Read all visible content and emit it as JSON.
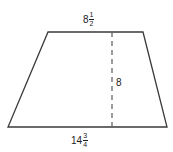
{
  "figure": {
    "type": "geometry-diagram",
    "shape": "trapezoid",
    "background_color": "#ffffff",
    "stroke_color": "#3a3a3a",
    "text_color": "#1c1c1c",
    "labels": {
      "top_base": {
        "text": "8 1/2",
        "whole": "8",
        "numerator": "1",
        "denominator": "2"
      },
      "height": {
        "text": "8",
        "whole": "8"
      },
      "bottom_base": {
        "text": "14 3/4",
        "whole": "14",
        "numerator": "3",
        "denominator": "4"
      }
    },
    "geometry": {
      "top_left": [
        48,
        32
      ],
      "top_right": [
        143,
        32
      ],
      "bottom_right": [
        167,
        127
      ],
      "bottom_left": [
        8,
        127
      ],
      "height_line_x": 112,
      "height_line_top_y": 32,
      "height_line_bottom_y": 127,
      "height_line_style": "dashed"
    }
  }
}
